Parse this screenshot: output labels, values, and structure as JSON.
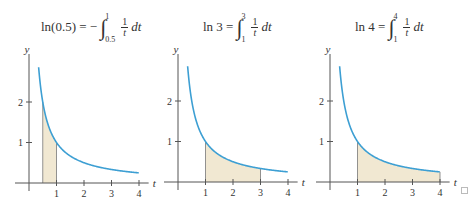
{
  "figure": {
    "panels": [
      {
        "title": {
          "lhs": "ln(0.5) = −",
          "upper": "1",
          "lower": "0.5",
          "num": "1",
          "den": "t",
          "dt": "dt"
        },
        "ylabel": "y",
        "xlabel": "t",
        "xticks": [
          "1",
          "2",
          "3",
          "4"
        ],
        "yticks": [
          "1",
          "2"
        ],
        "shade": [
          0.5,
          1
        ]
      },
      {
        "title": {
          "lhs": "ln 3 =",
          "upper": "3",
          "lower": "1",
          "num": "1",
          "den": "t",
          "dt": "dt"
        },
        "ylabel": "y",
        "xlabel": "t",
        "xticks": [
          "1",
          "2",
          "3",
          "4"
        ],
        "yticks": [
          "1",
          "2"
        ],
        "shade": [
          1,
          3
        ]
      },
      {
        "title": {
          "lhs": "ln 4 =",
          "upper": "4",
          "lower": "1",
          "num": "1",
          "den": "t",
          "dt": "dt"
        },
        "ylabel": "y",
        "xlabel": "t",
        "xticks": [
          "1",
          "2",
          "3",
          "4"
        ],
        "yticks": [
          "1",
          "2"
        ],
        "shade": [
          1,
          4
        ]
      }
    ],
    "colors": {
      "curve": "#3d9fd3",
      "fill": "#f1e8d2",
      "axis": "#555555",
      "text": "#333333"
    }
  },
  "chart_data": [
    {
      "type": "area",
      "title": "ln(0.5) = −∫_{0.5}^{1} (1/t) dt",
      "function": "y = 1/t",
      "xlabel": "t",
      "ylabel": "y",
      "x": [
        0.35,
        0.5,
        1,
        2,
        3,
        4
      ],
      "y": [
        2.86,
        2,
        1,
        0.5,
        0.333,
        0.25
      ],
      "shaded_interval": [
        0.5,
        1
      ],
      "xticks": [
        1,
        2,
        3,
        4
      ],
      "yticks": [
        1,
        2
      ],
      "xlim": [
        -0.5,
        4.4
      ],
      "ylim": [
        0,
        3.2
      ],
      "grid": false
    },
    {
      "type": "area",
      "title": "ln 3 = ∫_{1}^{3} (1/t) dt",
      "function": "y = 1/t",
      "xlabel": "t",
      "ylabel": "y",
      "x": [
        0.35,
        0.5,
        1,
        2,
        3,
        4
      ],
      "y": [
        2.86,
        2,
        1,
        0.5,
        0.333,
        0.25
      ],
      "shaded_interval": [
        1,
        3
      ],
      "xticks": [
        1,
        2,
        3,
        4
      ],
      "yticks": [
        1,
        2
      ],
      "xlim": [
        -0.5,
        4.4
      ],
      "ylim": [
        0,
        3.2
      ],
      "grid": false
    },
    {
      "type": "area",
      "title": "ln 4 = ∫_{1}^{4} (1/t) dt",
      "function": "y = 1/t",
      "xlabel": "t",
      "ylabel": "y",
      "x": [
        0.35,
        0.5,
        1,
        2,
        3,
        4
      ],
      "y": [
        2.86,
        2,
        1,
        0.5,
        0.333,
        0.25
      ],
      "shaded_interval": [
        1,
        4
      ],
      "xticks": [
        1,
        2,
        3,
        4
      ],
      "yticks": [
        1,
        2
      ],
      "xlim": [
        -0.5,
        4.4
      ],
      "ylim": [
        0,
        3.2
      ],
      "grid": false
    }
  ]
}
